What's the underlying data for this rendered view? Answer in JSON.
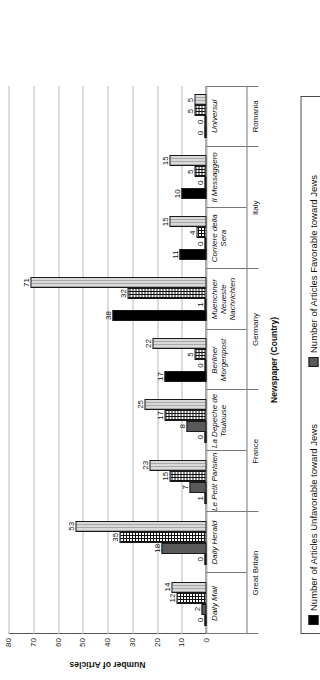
{
  "chart_data": {
    "type": "bar",
    "title": "",
    "xlabel": "Newspaper (Country)",
    "ylabel": "Number of Articles",
    "ylim": [
      0,
      80
    ],
    "yticks": [
      0,
      10,
      20,
      30,
      40,
      50,
      60,
      70,
      80
    ],
    "grid": true,
    "orientation": "vertical-rotated-90ccw",
    "legend_position": "below-plot-boxed",
    "categories": [
      "Daily Mail",
      "Daily Herald",
      "Le Petit Parisien",
      "La Depeche de Toulouse",
      "Berliner Morgenpost",
      "Muenchner Neueste Nachrichten",
      "Corriere della Sera",
      "Il Messaggero",
      "Universul"
    ],
    "countries": [
      {
        "name": "Great Britain",
        "span": 2
      },
      {
        "name": "France",
        "span": 2
      },
      {
        "name": "Germany",
        "span": 2
      },
      {
        "name": "Italy",
        "span": 2
      },
      {
        "name": "Romania",
        "span": 1
      }
    ],
    "series": [
      {
        "name": "Number of Articles Unfavorable toward Jews",
        "color": "#000000",
        "pattern": "solid-black",
        "values": [
          0,
          0,
          1,
          0,
          17,
          38,
          11,
          10,
          0
        ]
      },
      {
        "name": "Number of Articles Favorable toward Jews",
        "color": "#595959",
        "pattern": "solid-darkgray",
        "values": [
          2,
          18,
          7,
          8,
          0,
          1,
          0,
          0,
          0
        ]
      },
      {
        "name": "Number of Articles Neutral in Orientation toward Jews",
        "color": "#ffffff",
        "pattern": "crosshatch-grid",
        "values": [
          12,
          35,
          15,
          17,
          5,
          32,
          4,
          5,
          5
        ]
      },
      {
        "name": "Total Number of Articles",
        "color": "#d9d9d9",
        "pattern": "light-vertical-stripes",
        "values": [
          14,
          53,
          23,
          25,
          22,
          71,
          15,
          15,
          5
        ]
      }
    ]
  },
  "legend": {
    "items": [
      "Number of Articles Unfavorable toward Jews",
      "Number of Articles Favorable toward Jews",
      "Number of Articles Neutral in Orientation toward Jews",
      "Total Number of Articles"
    ]
  }
}
